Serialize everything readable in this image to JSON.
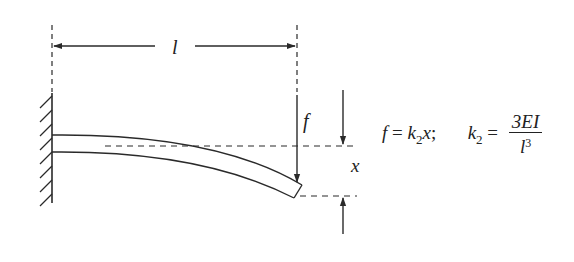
{
  "diagram": {
    "type": "cantilever-beam-stiffness",
    "labels": {
      "length": "l",
      "force": "f",
      "deflection": "x"
    },
    "equation": {
      "lhs1": "f",
      "eq1": " = ",
      "k": "k",
      "k_sub": "2",
      "x": "x",
      "sep": ";",
      "lhs2_k": "k",
      "lhs2_sub": "2",
      "eq2": " = ",
      "numerator": "3EI",
      "denominator_base": "l",
      "denominator_exp": "3"
    },
    "colors": {
      "stroke": "#2a2a2a",
      "background": "#ffffff"
    }
  }
}
